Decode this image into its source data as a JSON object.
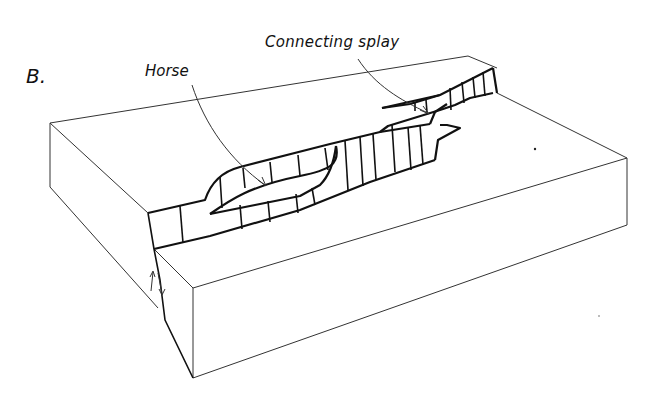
{
  "diagram": {
    "panel_label": "B.",
    "labels": {
      "horse": "Horse",
      "connecting_splay": "Connecting splay"
    },
    "colors": {
      "line": "#111111",
      "background": "#ffffff"
    }
  }
}
